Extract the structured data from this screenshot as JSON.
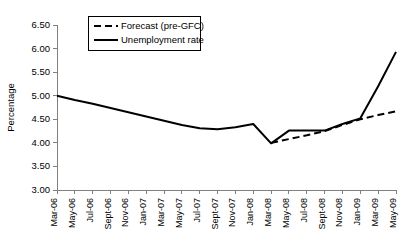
{
  "chart_data": {
    "type": "line",
    "title": "",
    "xlabel": "",
    "ylabel": "Percentage",
    "ylim": [
      3.0,
      6.5
    ],
    "ytick_step": 0.5,
    "ytick_labels": [
      "3.00",
      "3.50",
      "4.00",
      "4.50",
      "5.00",
      "5.50",
      "6.00",
      "6.50"
    ],
    "ytick_values": [
      3.0,
      3.5,
      4.0,
      4.5,
      5.0,
      5.5,
      6.0,
      6.5
    ],
    "grid": false,
    "legend_position": "top-left",
    "categories": [
      "Mar-06",
      "May-06",
      "Jul-06",
      "Sept-06",
      "Nov-06",
      "Jan-07",
      "Mar-07",
      "May-07",
      "Jul-07",
      "Sept-07",
      "Nov-07",
      "Jan-08",
      "Mar-08",
      "May-08",
      "Jul-08",
      "Sept-08",
      "Nov-08",
      "Jan-09",
      "Mar-09",
      "May-09"
    ],
    "series": [
      {
        "name": "Forecast (pre-GFC)",
        "style": "dashed",
        "color": "#000000",
        "values": [
          null,
          null,
          null,
          null,
          null,
          null,
          null,
          null,
          null,
          null,
          null,
          null,
          4.0,
          4.08,
          4.16,
          4.25,
          4.38,
          4.5,
          4.59,
          4.67
        ]
      },
      {
        "name": "Unemployment rate",
        "style": "solid",
        "color": "#000000",
        "values": [
          5.0,
          4.91,
          4.83,
          4.74,
          4.65,
          4.56,
          4.47,
          4.38,
          4.31,
          4.29,
          4.33,
          4.4,
          3.99,
          4.26,
          4.26,
          4.26,
          4.4,
          4.52,
          5.2,
          5.93
        ]
      }
    ]
  },
  "layout": {
    "plot_left": 57,
    "plot_right": 396,
    "plot_top": 25,
    "plot_bottom": 190
  },
  "legend": {
    "box": {
      "x": 88,
      "y": 16,
      "width": 112,
      "height": 34
    },
    "entries": [
      {
        "label": "Forecast (pre-GFC)",
        "style": "dashed"
      },
      {
        "label": "Unemployment rate",
        "style": "solid"
      }
    ]
  }
}
